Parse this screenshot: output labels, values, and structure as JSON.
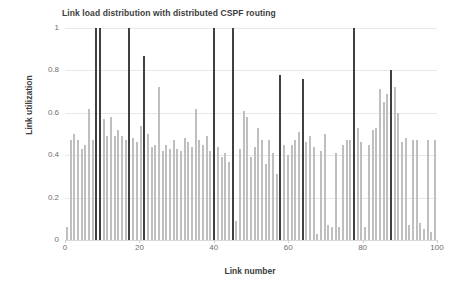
{
  "chart_data": {
    "type": "bar",
    "title": "Link load distribution with distributed CSPF routing",
    "xlabel": "Link number",
    "ylabel": "Link utilization",
    "xlim": [
      0,
      100
    ],
    "ylim": [
      0,
      1
    ],
    "x_ticks": [
      0,
      20,
      40,
      60,
      80,
      100
    ],
    "y_ticks": [
      0,
      0.2,
      0.4,
      0.6,
      0.8,
      1
    ],
    "grid": "horizontal",
    "legend": null,
    "series_name": "Link utilization",
    "bar_color_normal": "#bfbfbf",
    "bar_color_highlight": "#404040",
    "highlight_note": "Dark bars mark the most heavily loaded (congested) links",
    "x": [
      0,
      1,
      2,
      3,
      4,
      5,
      6,
      7,
      8,
      9,
      10,
      11,
      12,
      13,
      14,
      15,
      16,
      17,
      18,
      19,
      20,
      21,
      22,
      23,
      24,
      25,
      26,
      27,
      28,
      29,
      30,
      31,
      32,
      33,
      34,
      35,
      36,
      37,
      38,
      39,
      40,
      41,
      42,
      43,
      44,
      45,
      46,
      47,
      48,
      49,
      50,
      51,
      52,
      53,
      54,
      55,
      56,
      57,
      58,
      59,
      60,
      61,
      62,
      63,
      64,
      65,
      66,
      67,
      68,
      69,
      70,
      71,
      72,
      73,
      74,
      75,
      76,
      77,
      78,
      79,
      80,
      81,
      82,
      83,
      84,
      85,
      86,
      87,
      88,
      89,
      90,
      91,
      92,
      93,
      94,
      95,
      96,
      97,
      98,
      99,
      100
    ],
    "values": [
      0.06,
      0.47,
      0.5,
      0.47,
      0.43,
      0.45,
      0.62,
      0.47,
      1.0,
      1.0,
      0.57,
      0.49,
      0.58,
      0.49,
      0.52,
      0.49,
      0.47,
      1.0,
      0.48,
      0.46,
      0.54,
      0.87,
      0.5,
      0.44,
      0.45,
      0.72,
      0.42,
      0.45,
      0.43,
      0.47,
      0.43,
      0.42,
      0.48,
      0.46,
      0.44,
      0.62,
      0.47,
      0.45,
      0.49,
      0.42,
      1.0,
      0.44,
      0.39,
      0.41,
      0.37,
      1.0,
      0.09,
      0.43,
      0.61,
      0.58,
      0.39,
      0.44,
      0.53,
      0.47,
      0.36,
      0.47,
      0.41,
      0.31,
      0.78,
      0.45,
      0.4,
      0.45,
      0.47,
      0.51,
      0.76,
      0.46,
      0.49,
      0.44,
      0.03,
      0.42,
      0.5,
      0.07,
      0.06,
      0.41,
      0.06,
      0.45,
      0.47,
      0.47,
      1.0,
      0.53,
      0.46,
      0.06,
      0.45,
      0.52,
      0.53,
      0.71,
      0.65,
      0.69,
      0.8,
      0.72,
      0.6,
      0.46,
      0.48,
      0.07,
      0.47,
      0.47,
      0.08,
      0.05,
      0.47,
      0.04,
      0.47
    ],
    "highlight_indices": [
      8,
      9,
      17,
      21,
      40,
      45,
      58,
      64,
      78,
      88
    ]
  }
}
